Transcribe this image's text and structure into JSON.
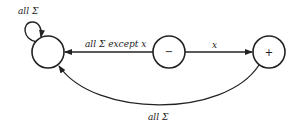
{
  "diagram": {
    "type": "finite-automaton",
    "states": [
      {
        "id": "dead",
        "label": "",
        "cx": 48,
        "cy": 52
      },
      {
        "id": "minus",
        "label": "−",
        "cx": 169,
        "cy": 52
      },
      {
        "id": "plus",
        "label": "+",
        "cx": 269,
        "cy": 52
      }
    ],
    "transitions": [
      {
        "from": "dead",
        "to": "dead",
        "label": "all Σ"
      },
      {
        "from": "minus",
        "to": "dead",
        "label": "all Σ except x"
      },
      {
        "from": "minus",
        "to": "plus",
        "label": "x"
      },
      {
        "from": "plus",
        "to": "dead",
        "label": "all Σ"
      }
    ]
  }
}
